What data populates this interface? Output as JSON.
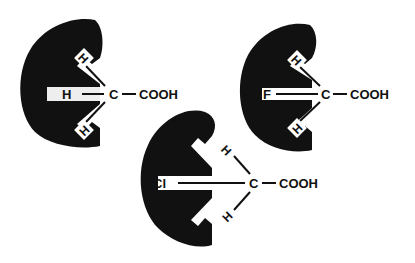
{
  "diagram": {
    "colors": {
      "enzyme": "#111111",
      "background": "#ffffff",
      "slot": "#f2f2f2"
    },
    "panels": [
      {
        "id": "acetic-acid",
        "substituent": "H",
        "carbon": "C",
        "group": "COOH",
        "hydrogens": [
          "H",
          "H"
        ]
      },
      {
        "id": "fluoroacetic-acid",
        "substituent": "F",
        "carbon": "C",
        "group": "COOH",
        "hydrogens": [
          "H",
          "H"
        ]
      },
      {
        "id": "chloroacetic-acid",
        "substituent": "Cl",
        "carbon": "C",
        "group": "COOH",
        "hydrogens": [
          "H",
          "H"
        ]
      }
    ]
  }
}
